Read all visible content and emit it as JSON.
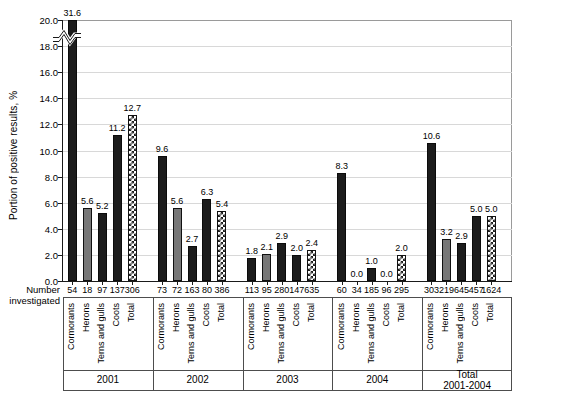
{
  "chart_data": {
    "type": "bar",
    "title": "",
    "xlabel": "",
    "ylabel": "Portion of positive results, %",
    "ylim": [
      0,
      20
    ],
    "y_ticks": [
      "0.0",
      "2.0",
      "4.0",
      "6.0",
      "8.0",
      "10.0",
      "12.0",
      "14.0",
      "16.0",
      "18.0",
      "20.0"
    ],
    "grid": true,
    "legend_position": "none",
    "axis_break": {
      "present": true,
      "at": 18.9,
      "note": "y-axis broken; first bar value 31.6 exceeds axis maximum 20.0"
    },
    "row_header": "Number investigated",
    "categories": [
      "Cormorants",
      "Herons",
      "Terns and gulls",
      "Coots",
      "Total"
    ],
    "groups": [
      {
        "label": "2001",
        "values": [
          31.6,
          5.6,
          5.2,
          11.2,
          12.7
        ],
        "value_labels": [
          "31.6",
          "5.6",
          "5.2",
          "11.2",
          "12.7"
        ],
        "number_investigated": [
          "54",
          "18",
          "97",
          "137",
          "306"
        ],
        "styles": [
          "dark",
          "gray",
          "dark",
          "dark",
          "pattern"
        ],
        "clipped": [
          true,
          false,
          false,
          false,
          false
        ]
      },
      {
        "label": "2002",
        "values": [
          9.6,
          5.6,
          2.7,
          6.3,
          5.4
        ],
        "value_labels": [
          "9.6",
          "5.6",
          "2.7",
          "6.3",
          "5.4"
        ],
        "number_investigated": [
          "73",
          "72",
          "163",
          "80",
          "386"
        ],
        "styles": [
          "dark",
          "gray",
          "dark",
          "dark",
          "pattern"
        ],
        "clipped": [
          false,
          false,
          false,
          false,
          false
        ]
      },
      {
        "label": "2003",
        "values": [
          1.8,
          2.1,
          2.9,
          2.0,
          2.4
        ],
        "value_labels": [
          "1.8",
          "2.1",
          "2.9",
          "2.0",
          "2.4"
        ],
        "number_investigated": [
          "113",
          "95",
          "280",
          "147",
          "635"
        ],
        "styles": [
          "dark",
          "gray",
          "dark",
          "dark",
          "pattern"
        ],
        "clipped": [
          false,
          false,
          false,
          false,
          false
        ]
      },
      {
        "label": "2004",
        "values": [
          8.3,
          0.0,
          1.0,
          0.0,
          2.0
        ],
        "value_labels": [
          "8.3",
          "0.0",
          "1.0",
          "0.0",
          "2.0"
        ],
        "number_investigated": [
          "60",
          "34",
          "185",
          "96",
          "295"
        ],
        "styles": [
          "dark",
          "gray",
          "dark",
          "dark",
          "pattern"
        ],
        "clipped": [
          false,
          false,
          false,
          false,
          false
        ]
      },
      {
        "label": "Total\n2001-2004",
        "label_line1": "Total",
        "label_line2": "2001-2004",
        "values": [
          10.6,
          3.2,
          2.9,
          5.0,
          5.0
        ],
        "value_labels": [
          "10.6",
          "3.2",
          "2.9",
          "5.0",
          "5.0"
        ],
        "number_investigated": [
          "303",
          "219",
          "645",
          "457",
          "1624"
        ],
        "styles": [
          "dark",
          "gray",
          "dark",
          "dark",
          "pattern"
        ],
        "clipped": [
          false,
          false,
          false,
          false,
          false
        ]
      }
    ],
    "colors": {
      "dark": "#1c1c1c",
      "gray": "#777777",
      "pattern_fill": "#ffffff",
      "pattern_stroke": "#1c1c1c",
      "axis": "#1a1a1a",
      "grid": "#d8d8d8"
    }
  }
}
